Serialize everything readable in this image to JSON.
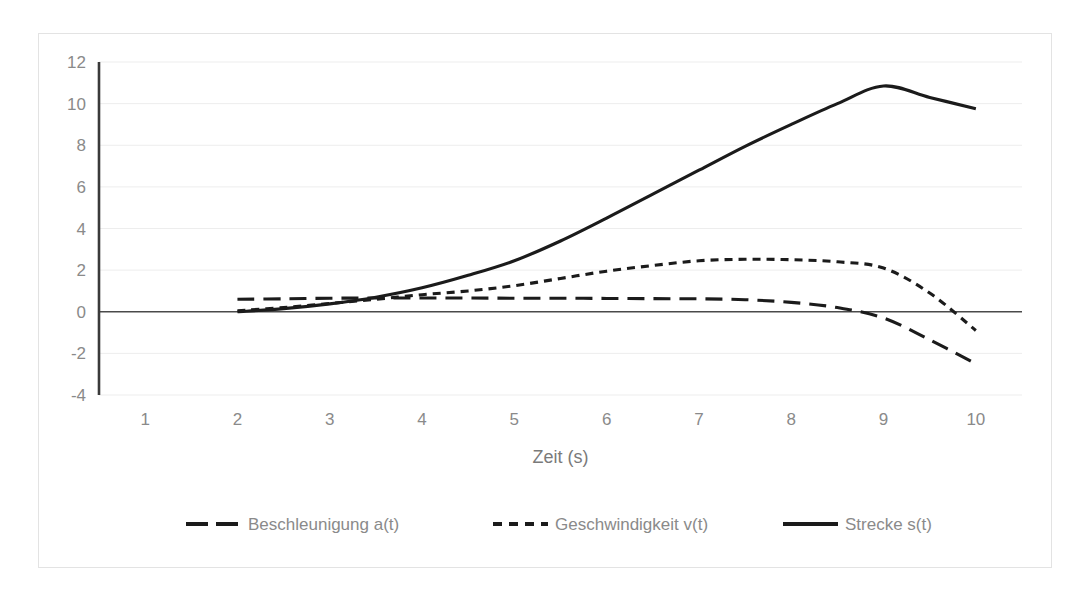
{
  "chart_data": {
    "type": "line",
    "title": "",
    "xlabel": "Zeit (s)",
    "ylabel": "",
    "xlim": [
      0.5,
      10.5
    ],
    "ylim": [
      -4,
      12
    ],
    "grid": true,
    "legend_position": "bottom",
    "xticks": [
      "1",
      "2",
      "3",
      "4",
      "5",
      "6",
      "7",
      "8",
      "9",
      "10"
    ],
    "xtick_values": [
      1,
      2,
      3,
      4,
      5,
      6,
      7,
      8,
      9,
      10
    ],
    "yticks": [
      "12",
      "10",
      "8",
      "6",
      "4",
      "2",
      "0",
      "-2",
      "-4"
    ],
    "ytick_values": [
      12,
      10,
      8,
      6,
      4,
      2,
      0,
      -2,
      -4
    ],
    "x": [
      2,
      2.5,
      3,
      3.5,
      4,
      4.5,
      5,
      5.5,
      6,
      6.5,
      7,
      7.5,
      8,
      8.5,
      9,
      9.5,
      10
    ],
    "series": [
      {
        "name": "Beschleunigung a(t)",
        "style": "dashed",
        "color": "#1b1b1b",
        "values": [
          0.6,
          0.62,
          0.65,
          0.66,
          0.66,
          0.66,
          0.65,
          0.65,
          0.64,
          0.63,
          0.62,
          0.58,
          0.45,
          0.2,
          -0.3,
          -1.35,
          -2.5
        ]
      },
      {
        "name": "Geschwindigkeit v(t)",
        "style": "dotted",
        "color": "#1b1b1b",
        "values": [
          0.05,
          0.2,
          0.4,
          0.6,
          0.82,
          1.0,
          1.25,
          1.6,
          1.95,
          2.22,
          2.45,
          2.52,
          2.5,
          2.4,
          2.1,
          0.9,
          -0.9
        ]
      },
      {
        "name": "Strecke s(t)",
        "style": "solid",
        "color": "#1b1b1b",
        "values": [
          0.0,
          0.15,
          0.38,
          0.7,
          1.15,
          1.75,
          2.45,
          3.4,
          4.5,
          5.65,
          6.8,
          7.95,
          9.0,
          10.0,
          10.85,
          10.3,
          9.75
        ]
      }
    ]
  },
  "axis": {
    "x_title": "Zeit (s)"
  },
  "legend": {
    "items": [
      {
        "label": "Beschleunigung a(t)",
        "style": "dashed"
      },
      {
        "label": "Geschwindigkeit v(t)",
        "style": "dotted"
      },
      {
        "label": "Strecke s(t)",
        "style": "solid"
      }
    ]
  },
  "colors": {
    "line": "#1b1b1b",
    "grid": "#ededed",
    "text": "#8a8a8a",
    "frame": "#e3e3e3",
    "background": "#ffffff"
  }
}
